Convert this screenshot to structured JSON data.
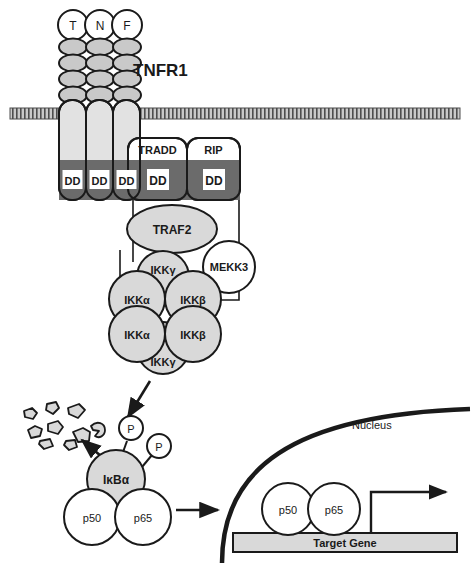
{
  "diagram": {
    "title_visible": "TNFR1",
    "receptor_label": "TNFR1",
    "ligand": {
      "name": "TNF",
      "subunits": [
        "T",
        "N",
        "F"
      ]
    },
    "death_domain_label": "DD",
    "receptor_chains_dd": [
      "DD",
      "DD",
      "DD"
    ],
    "adaptors": [
      {
        "name": "TRADD",
        "dd": "DD"
      },
      {
        "name": "RIP",
        "dd": "DD"
      }
    ],
    "traf2": "TRAF2",
    "mekk3": "MEKK3",
    "ikk_complex": {
      "gamma_top": "IKKγ",
      "gamma_bottom": "IKKγ",
      "subunits": [
        {
          "label": "IKKα"
        },
        {
          "label": "IKKβ"
        },
        {
          "label": "IKKα"
        },
        {
          "label": "IKKβ"
        }
      ]
    },
    "ikba": "IκBα",
    "phospho": [
      "P",
      "P"
    ],
    "nfkb_cytoplasm": [
      "p50",
      "p65"
    ],
    "nfkb_nucleus": [
      "p50",
      "p65"
    ],
    "nucleus_label": "Nucleus",
    "target_gene": "Target Gene",
    "colors": {
      "outline": "#1a1a1a",
      "fill_gray": "#d9d9d9",
      "fill_dark": "#6b6b6b",
      "fill_white": "#ffffff",
      "membrane": "#9a9a9a",
      "gene_bar": "#d9d9d9"
    }
  }
}
